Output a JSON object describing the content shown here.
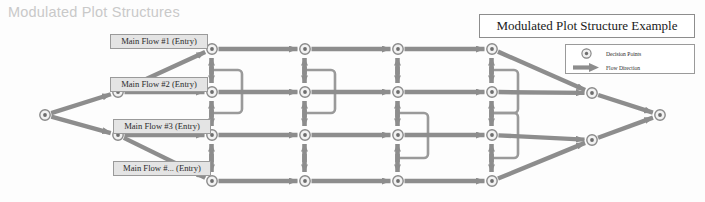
{
  "page": {
    "title": "Modulated Plot Structures",
    "background_color": "#fdfdfd",
    "title_color": "#c9c9c9"
  },
  "diagram": {
    "title_box": {
      "label": "Modulated Plot Structure Example"
    },
    "legend": {
      "items": [
        {
          "icon": "decision-point-icon",
          "label": "Decision Points"
        },
        {
          "icon": "flow-arrow-icon",
          "label": "Flow Direction"
        }
      ]
    },
    "entry_labels": [
      {
        "label": "Main Flow #1 (Entry)",
        "x": 110,
        "y": 34,
        "w": 98
      },
      {
        "label": "Main Flow #2 (Entry)",
        "x": 110,
        "y": 77,
        "w": 98
      },
      {
        "label": "Main Flow #3 (Entry)",
        "x": 113,
        "y": 119,
        "w": 98
      },
      {
        "label": "Main Flow #... (Entry)",
        "x": 113,
        "y": 161,
        "w": 98
      }
    ],
    "colors": {
      "arrow": "#8d8d8d",
      "arrow_dark": "#7a7a7a",
      "node_fill": "#f2f2f2",
      "node_stroke": "#8a8a8a",
      "bracket": "#9a9a9a",
      "box_fill": "#e4e4e4",
      "box_stroke": "#9a9a9a"
    },
    "nodes": [
      {
        "name": "start-node",
        "id": "S",
        "x": 45,
        "y": 115
      },
      {
        "name": "split-node-a",
        "id": "A",
        "x": 118,
        "y": 92
      },
      {
        "name": "split-node-b",
        "id": "B",
        "x": 118,
        "y": 135
      },
      {
        "name": "grid-node-r1c1",
        "id": "r1c1",
        "x": 212,
        "y": 49
      },
      {
        "name": "grid-node-r2c1",
        "id": "r2c1",
        "x": 212,
        "y": 92
      },
      {
        "name": "grid-node-r3c1",
        "id": "r3c1",
        "x": 212,
        "y": 135
      },
      {
        "name": "grid-node-r4c1",
        "id": "r4c1",
        "x": 212,
        "y": 181
      },
      {
        "name": "grid-node-r1c2",
        "id": "r1c2",
        "x": 305,
        "y": 49
      },
      {
        "name": "grid-node-r2c2",
        "id": "r2c2",
        "x": 305,
        "y": 92
      },
      {
        "name": "grid-node-r3c2",
        "id": "r3c2",
        "x": 305,
        "y": 135
      },
      {
        "name": "grid-node-r4c2",
        "id": "r4c2",
        "x": 305,
        "y": 181
      },
      {
        "name": "grid-node-r1c3",
        "id": "r1c3",
        "x": 398,
        "y": 49
      },
      {
        "name": "grid-node-r2c3",
        "id": "r2c3",
        "x": 398,
        "y": 92
      },
      {
        "name": "grid-node-r3c3",
        "id": "r3c3",
        "x": 398,
        "y": 135
      },
      {
        "name": "grid-node-r4c3",
        "id": "r4c3",
        "x": 398,
        "y": 181
      },
      {
        "name": "grid-node-r1c4",
        "id": "r1c4",
        "x": 492,
        "y": 49
      },
      {
        "name": "grid-node-r2c4",
        "id": "r2c4",
        "x": 492,
        "y": 92
      },
      {
        "name": "grid-node-r3c4",
        "id": "r3c4",
        "x": 492,
        "y": 135
      },
      {
        "name": "grid-node-r4c4",
        "id": "r4c4",
        "x": 492,
        "y": 181
      },
      {
        "name": "merge-node-top",
        "id": "M1",
        "x": 592,
        "y": 93
      },
      {
        "name": "merge-node-bot",
        "id": "M2",
        "x": 592,
        "y": 140
      },
      {
        "name": "end-node",
        "id": "E",
        "x": 660,
        "y": 115
      }
    ],
    "flow_edges": [
      {
        "from": "S",
        "to": "A"
      },
      {
        "from": "S",
        "to": "B"
      },
      {
        "from": "A",
        "to": "r1c1"
      },
      {
        "from": "A",
        "to": "r2c1"
      },
      {
        "from": "B",
        "to": "r3c1"
      },
      {
        "from": "B",
        "to": "r4c1"
      },
      {
        "from": "r1c1",
        "to": "r1c2"
      },
      {
        "from": "r1c2",
        "to": "r1c3"
      },
      {
        "from": "r1c3",
        "to": "r1c4"
      },
      {
        "from": "r2c1",
        "to": "r2c2"
      },
      {
        "from": "r2c2",
        "to": "r2c3"
      },
      {
        "from": "r2c3",
        "to": "r2c4"
      },
      {
        "from": "r3c1",
        "to": "r3c2"
      },
      {
        "from": "r3c2",
        "to": "r3c3"
      },
      {
        "from": "r3c3",
        "to": "r3c4"
      },
      {
        "from": "r4c1",
        "to": "r4c2"
      },
      {
        "from": "r4c2",
        "to": "r4c3"
      },
      {
        "from": "r4c3",
        "to": "r4c4"
      },
      {
        "from": "r1c4",
        "to": "M1"
      },
      {
        "from": "r2c4",
        "to": "M1"
      },
      {
        "from": "r3c4",
        "to": "M2"
      },
      {
        "from": "r4c4",
        "to": "M2"
      },
      {
        "from": "M1",
        "to": "E"
      },
      {
        "from": "M2",
        "to": "E"
      }
    ],
    "bidirectional_links": [
      {
        "col": 212,
        "from_y": 49,
        "to_y": 92
      },
      {
        "col": 212,
        "from_y": 92,
        "to_y": 135
      },
      {
        "col": 212,
        "from_y": 135,
        "to_y": 181
      },
      {
        "col": 305,
        "from_y": 49,
        "to_y": 92
      },
      {
        "col": 305,
        "from_y": 92,
        "to_y": 135
      },
      {
        "col": 305,
        "from_y": 135,
        "to_y": 181
      },
      {
        "col": 398,
        "from_y": 49,
        "to_y": 92
      },
      {
        "col": 398,
        "from_y": 92,
        "to_y": 135
      },
      {
        "col": 398,
        "from_y": 135,
        "to_y": 181
      },
      {
        "col": 492,
        "from_y": 49,
        "to_y": 92
      },
      {
        "col": 492,
        "from_y": 92,
        "to_y": 135
      },
      {
        "col": 492,
        "from_y": 135,
        "to_y": 181
      }
    ],
    "bracket_connectors": [
      {
        "name": "bracket-c1-upper",
        "x": 212,
        "y_top": 70,
        "y_bot": 113,
        "reach": 30
      },
      {
        "name": "bracket-c2-upper",
        "x": 305,
        "y_top": 70,
        "y_bot": 113,
        "reach": 30
      },
      {
        "name": "bracket-c3-lower",
        "x": 398,
        "y_top": 113,
        "y_bot": 158,
        "reach": 30
      },
      {
        "name": "bracket-c4-upper",
        "x": 492,
        "y_top": 70,
        "y_bot": 113,
        "reach": 26
      },
      {
        "name": "bracket-c4-lower",
        "x": 492,
        "y_top": 113,
        "y_bot": 158,
        "reach": 26
      }
    ]
  }
}
